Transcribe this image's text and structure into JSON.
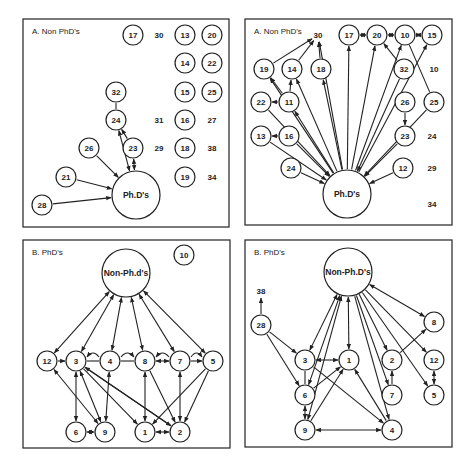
{
  "figure": {
    "panels": [
      {
        "id": "A-left",
        "title": "A. Non PhD's",
        "hub": {
          "id": "PhDs",
          "label": "Ph.D's"
        },
        "nodes": [
          "17",
          "13",
          "20",
          "14",
          "22",
          "32",
          "15",
          "25",
          "24",
          "16",
          "26",
          "23",
          "18",
          "21",
          "19",
          "28"
        ],
        "isolates_text": [
          "30",
          "31",
          "27",
          "29",
          "38",
          "34"
        ],
        "edges": [
          {
            "from": "32",
            "to": "24",
            "dir": "none"
          },
          {
            "from": "24",
            "to": "PhDs",
            "dir": "both"
          },
          {
            "from": "23",
            "to": "24",
            "dir": "forward"
          },
          {
            "from": "23",
            "to": "PhDs",
            "dir": "both"
          },
          {
            "from": "26",
            "to": "PhDs",
            "dir": "forward"
          },
          {
            "from": "21",
            "to": "PhDs",
            "dir": "forward"
          },
          {
            "from": "28",
            "to": "PhDs",
            "dir": "forward"
          }
        ]
      },
      {
        "id": "A-right",
        "title": "A. Non PhD's",
        "hub": {
          "id": "PhDs",
          "label": "Ph.D's"
        },
        "nodes": [
          "17",
          "20",
          "10",
          "15",
          "19",
          "14",
          "18",
          "32",
          "22",
          "11",
          "26",
          "25",
          "13",
          "16",
          "23",
          "24",
          "12"
        ],
        "isolates_text": [
          "30",
          "10",
          "24",
          "29",
          "34"
        ],
        "edges": [
          {
            "from": "17",
            "to": "20",
            "dir": "both"
          },
          {
            "from": "20",
            "to": "10",
            "dir": "both"
          },
          {
            "from": "10",
            "to": "15",
            "dir": "both"
          },
          {
            "from": "32",
            "to": "20",
            "dir": "forward"
          },
          {
            "from": "19",
            "to": "30",
            "dir": "forward"
          },
          {
            "from": "14",
            "to": "30",
            "dir": "forward"
          },
          {
            "from": "18",
            "to": "30",
            "dir": "forward"
          },
          {
            "from": "11",
            "to": "14",
            "dir": "forward"
          },
          {
            "from": "11",
            "to": "19",
            "dir": "forward"
          },
          {
            "from": "11",
            "to": "22",
            "dir": "forward"
          },
          {
            "from": "16",
            "to": "13",
            "dir": "forward"
          },
          {
            "from": "26",
            "to": "23",
            "dir": "forward"
          },
          {
            "from": "25",
            "to": "10",
            "dir": "none"
          },
          {
            "from": "PhDs",
            "to": "30",
            "dir": "forward"
          },
          {
            "from": "PhDs",
            "to": "17",
            "dir": "forward"
          },
          {
            "from": "PhDs",
            "to": "20",
            "dir": "forward"
          },
          {
            "from": "PhDs",
            "to": "10",
            "dir": "forward"
          },
          {
            "from": "PhDs",
            "to": "15",
            "dir": "forward"
          },
          {
            "from": "PhDs",
            "to": "19",
            "dir": "forward"
          },
          {
            "from": "PhDs",
            "to": "14",
            "dir": "forward"
          },
          {
            "from": "PhDs",
            "to": "18",
            "dir": "forward"
          },
          {
            "from": "PhDs",
            "to": "11",
            "dir": "forward"
          },
          {
            "from": "22",
            "to": "PhDs",
            "dir": "forward"
          },
          {
            "from": "13",
            "to": "PhDs",
            "dir": "forward"
          },
          {
            "from": "16",
            "to": "PhDs",
            "dir": "forward"
          },
          {
            "from": "24",
            "to": "PhDs",
            "dir": "forward"
          },
          {
            "from": "12",
            "to": "PhDs",
            "dir": "forward"
          },
          {
            "from": "23",
            "to": "PhDs",
            "dir": "forward"
          },
          {
            "from": "25",
            "to": "PhDs",
            "dir": "forward"
          },
          {
            "from": "32",
            "to": "PhDs",
            "dir": "forward"
          }
        ]
      },
      {
        "id": "B-left",
        "title": "B. PhD's",
        "hub": {
          "id": "NonPhDs",
          "label": "Non-Ph.d's"
        },
        "nodes": [
          "10",
          "12",
          "3",
          "4",
          "8",
          "7",
          "5",
          "6",
          "9",
          "1",
          "2"
        ],
        "isolates_text": [],
        "edges": [
          {
            "from": "NonPhDs",
            "to": "12",
            "dir": "both"
          },
          {
            "from": "NonPhDs",
            "to": "3",
            "dir": "both"
          },
          {
            "from": "NonPhDs",
            "to": "4",
            "dir": "both"
          },
          {
            "from": "NonPhDs",
            "to": "8",
            "dir": "both"
          },
          {
            "from": "NonPhDs",
            "to": "7",
            "dir": "both"
          },
          {
            "from": "NonPhDs",
            "to": "5",
            "dir": "both"
          },
          {
            "from": "12",
            "to": "3",
            "dir": "forward"
          },
          {
            "from": "3",
            "to": "4",
            "dir": "none"
          },
          {
            "from": "4",
            "to": "8",
            "dir": "none"
          },
          {
            "from": "8",
            "to": "7",
            "dir": "both"
          },
          {
            "from": "7",
            "to": "5",
            "dir": "forward"
          },
          {
            "from": "4",
            "to": "3",
            "dir": "arc-forward"
          },
          {
            "from": "4",
            "to": "8",
            "dir": "arc-forward"
          },
          {
            "from": "7",
            "to": "8",
            "dir": "arc-forward"
          },
          {
            "from": "7",
            "to": "5",
            "dir": "arc-forward"
          },
          {
            "from": "3",
            "to": "6",
            "dir": "both"
          },
          {
            "from": "3",
            "to": "9",
            "dir": "both"
          },
          {
            "from": "3",
            "to": "1",
            "dir": "forward"
          },
          {
            "from": "3",
            "to": "2",
            "dir": "forward"
          },
          {
            "from": "4",
            "to": "9",
            "dir": "both"
          },
          {
            "from": "8",
            "to": "1",
            "dir": "both"
          },
          {
            "from": "8",
            "to": "2",
            "dir": "forward"
          },
          {
            "from": "7",
            "to": "2",
            "dir": "both"
          },
          {
            "from": "5",
            "to": "1",
            "dir": "forward"
          },
          {
            "from": "5",
            "to": "2",
            "dir": "forward"
          },
          {
            "from": "12",
            "to": "9",
            "dir": "both"
          },
          {
            "from": "6",
            "to": "9",
            "dir": "both"
          },
          {
            "from": "1",
            "to": "2",
            "dir": "both"
          },
          {
            "from": "2",
            "to": "3",
            "dir": "forward"
          }
        ]
      },
      {
        "id": "B-right",
        "title": "B. PhD's",
        "hub": {
          "id": "NonPhDs",
          "label": "Non-Ph.D's"
        },
        "nodes": [
          "28",
          "8",
          "3",
          "1",
          "2",
          "12",
          "6",
          "7",
          "5",
          "9",
          "4"
        ],
        "isolates_text": [
          "38"
        ],
        "edges": [
          {
            "from": "28",
            "to": "38",
            "dir": "forward"
          },
          {
            "from": "28",
            "to": "3",
            "dir": "forward"
          },
          {
            "from": "28",
            "to": "6",
            "dir": "forward"
          },
          {
            "from": "NonPhDs",
            "to": "8",
            "dir": "both"
          },
          {
            "from": "NonPhDs",
            "to": "3",
            "dir": "both"
          },
          {
            "from": "NonPhDs",
            "to": "1",
            "dir": "both"
          },
          {
            "from": "NonPhDs",
            "to": "6",
            "dir": "both"
          },
          {
            "from": "NonPhDs",
            "to": "9",
            "dir": "both"
          },
          {
            "from": "NonPhDs",
            "to": "2",
            "dir": "forward"
          },
          {
            "from": "NonPhDs",
            "to": "7",
            "dir": "forward"
          },
          {
            "from": "NonPhDs",
            "to": "4",
            "dir": "forward"
          },
          {
            "from": "NonPhDs",
            "to": "12",
            "dir": "forward"
          },
          {
            "from": "NonPhDs",
            "to": "5",
            "dir": "forward"
          },
          {
            "from": "3",
            "to": "1",
            "dir": "both"
          },
          {
            "from": "3",
            "to": "6",
            "dir": "none"
          },
          {
            "from": "3",
            "to": "4",
            "dir": "forward"
          },
          {
            "from": "6",
            "to": "1",
            "dir": "forward"
          },
          {
            "from": "6",
            "to": "9",
            "dir": "both"
          },
          {
            "from": "9",
            "to": "1",
            "dir": "forward"
          },
          {
            "from": "9",
            "to": "4",
            "dir": "both"
          },
          {
            "from": "4",
            "to": "1",
            "dir": "forward"
          },
          {
            "from": "2",
            "to": "8",
            "dir": "forward"
          },
          {
            "from": "7",
            "to": "2",
            "dir": "forward"
          },
          {
            "from": "12",
            "to": "5",
            "dir": "both"
          }
        ]
      }
    ]
  }
}
